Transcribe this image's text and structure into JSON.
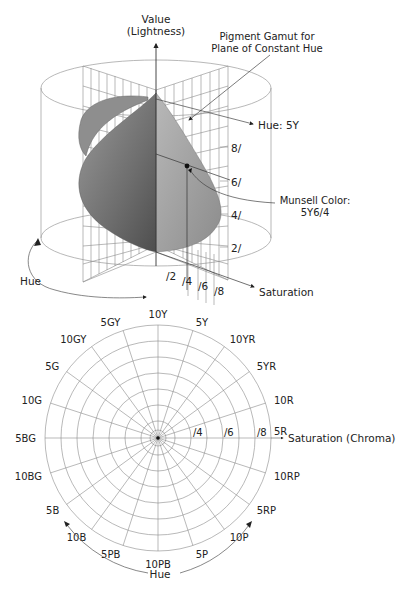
{
  "top_diagram": {
    "value_axis_label_line1": "Value",
    "value_axis_label_line2": "(Lightness)",
    "gamut_label_line1": "Pigment Gamut for",
    "gamut_label_line2": "Plane of Constant Hue",
    "hue_plane_label": "Hue: 5Y",
    "value_ticks": [
      "8/",
      "6/",
      "4/",
      "2/"
    ],
    "munsell_label_line1": "Munsell Color:",
    "munsell_label_line2": "5Y6/4",
    "saturation_ticks": [
      "/2",
      "/4",
      "/6",
      "/8"
    ],
    "saturation_axis_label": "Saturation",
    "hue_arrow_label": "Hue",
    "gamut_color_dark": "#5a5a5a",
    "gamut_color_light": "#a8a8a8"
  },
  "bottom_diagram": {
    "hue_labels": [
      "10Y",
      "5Y",
      "10YR",
      "5YR",
      "10R",
      "5R",
      "10RP",
      "5RP",
      "10P",
      "5P",
      "10PB",
      "5PB",
      "10B",
      "5B",
      "10BG",
      "5BG",
      "10G",
      "5G",
      "10GY",
      "5GY"
    ],
    "chroma_ticks": [
      "/4",
      "/6",
      "/8"
    ],
    "chroma_axis_label": "Saturation (Chroma)",
    "hue_arrow_label": "Hue"
  }
}
